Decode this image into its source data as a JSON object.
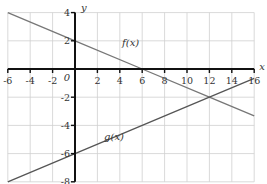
{
  "chart_data": {
    "type": "line",
    "title": "",
    "xlabel": "x",
    "ylabel": "y",
    "origin_label": "0",
    "xlim": [
      -6,
      16
    ],
    "ylim": [
      -8,
      4
    ],
    "grid": true,
    "legend": "none (inline labels)",
    "x_ticks": [
      -6,
      -4,
      -2,
      2,
      4,
      6,
      8,
      10,
      12,
      14,
      16
    ],
    "y_ticks": [
      4,
      2,
      -2,
      -4,
      -6,
      -8
    ],
    "series": [
      {
        "name": "f(x)",
        "label": "f(x)",
        "formula": "f(x) = -x/3 + 2",
        "x": [
          -6,
          0,
          6,
          12,
          16
        ],
        "values": [
          4,
          2,
          0,
          -2,
          -3.33
        ],
        "color": "#777777",
        "label_at": [
          4.2,
          1.6
        ]
      },
      {
        "name": "g(x)",
        "label": "g(x)",
        "formula": "g(x) = x/3 - 6",
        "x": [
          -6,
          0,
          12,
          16
        ],
        "values": [
          -8,
          -6,
          -2,
          -0.67
        ],
        "color": "#555555",
        "label_at": [
          2.6,
          -5.0
        ]
      }
    ],
    "annotations": [
      {
        "type": "intersection",
        "x": 12,
        "y": -2
      }
    ]
  }
}
